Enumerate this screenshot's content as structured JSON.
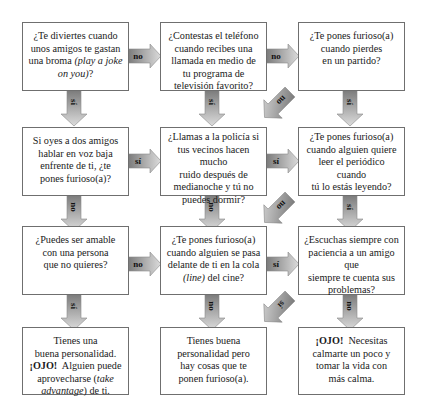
{
  "diagram": {
    "type": "flowchart",
    "colors": {
      "arrow_dark": "#7a7a7a",
      "arrow_light": "#d9d9d9",
      "border": "#6f6f6f"
    },
    "boxes": [
      {
        "id": "q1",
        "row": 1,
        "col": 1,
        "lines": [
          "¿Te diviertes cuando",
          "unos amigos te gastan",
          "una broma (play a joke",
          "on you)?"
        ],
        "italic_parts": [
          "play a joke on you"
        ]
      },
      {
        "id": "q2",
        "row": 1,
        "col": 2,
        "lines": [
          "¿Contestas el teléfono",
          "cuando recibes una",
          "llamada en medio de",
          "tu programa de",
          "televisión favorito?"
        ]
      },
      {
        "id": "q3",
        "row": 1,
        "col": 3,
        "lines": [
          "¿Te pones furioso(a)",
          "cuando pierdes",
          "en un partido?"
        ]
      },
      {
        "id": "q4",
        "row": 2,
        "col": 1,
        "lines": [
          "Si oyes a dos amigos",
          "hablar en voz baja",
          "enfrente de ti, ¿te",
          "pones furioso(a)?"
        ]
      },
      {
        "id": "q5",
        "row": 2,
        "col": 2,
        "lines": [
          "¿Llamas a la policía si",
          "tus vecinos hacen mucho",
          "ruido después de",
          "medianoche y tú no",
          "puedes dormir?"
        ]
      },
      {
        "id": "q6",
        "row": 2,
        "col": 3,
        "lines": [
          "¿Te pones furioso(a)",
          "cuando alguien quiere",
          "leer el periódico cuando",
          "tú lo estás leyendo?"
        ]
      },
      {
        "id": "q7",
        "row": 3,
        "col": 1,
        "lines": [
          "¿Puedes ser amable",
          "con una persona",
          "que no quieres?"
        ]
      },
      {
        "id": "q8",
        "row": 3,
        "col": 2,
        "lines": [
          "¿Te pones furioso(a)",
          "cuando alguien se pasa",
          "delante de ti en la cola",
          "(line) del cine?"
        ],
        "italic_parts": [
          "line"
        ]
      },
      {
        "id": "q9",
        "row": 3,
        "col": 3,
        "lines": [
          "¿Escuchas siempre con",
          "paciencia a un amigo que",
          "siempre te cuenta sus",
          "problemas?"
        ]
      },
      {
        "id": "r1",
        "row": 4,
        "col": 1,
        "lines": [
          "Tienes una",
          "buena personalidad.",
          "¡OJO! Alguien puede",
          "aprovecharse (take",
          "advantage) de ti."
        ],
        "bold_parts": [
          "¡OJO!"
        ],
        "italic_parts": [
          "take advantage"
        ]
      },
      {
        "id": "r2",
        "row": 4,
        "col": 2,
        "lines": [
          "Tienes buena",
          "personalidad pero",
          "hay cosas que te",
          "ponen furioso(a)."
        ]
      },
      {
        "id": "r3",
        "row": 4,
        "col": 3,
        "lines": [
          "¡OJO! Necesitas",
          "calmarte un poco y",
          "tomar la vida con",
          "más calma."
        ],
        "bold_parts": [
          "¡OJO!"
        ]
      }
    ],
    "arrows": [
      {
        "from": "q1",
        "to": "q2",
        "label": "no",
        "direction": "right"
      },
      {
        "from": "q2",
        "to": "q3",
        "label": "no",
        "direction": "right"
      },
      {
        "from": "q1",
        "to": "q4",
        "label": "sí",
        "direction": "down"
      },
      {
        "from": "q2",
        "to": "q5",
        "label": "sí",
        "direction": "down"
      },
      {
        "from": "q3",
        "to": "q6",
        "label": "sí",
        "direction": "down"
      },
      {
        "from": "q3",
        "to": "q5",
        "label": "no",
        "direction": "down-left"
      },
      {
        "from": "q4",
        "to": "q5",
        "label": "sí",
        "direction": "right"
      },
      {
        "from": "q5",
        "to": "q6",
        "label": "sí",
        "direction": "right"
      },
      {
        "from": "q4",
        "to": "q7",
        "label": "no",
        "direction": "down"
      },
      {
        "from": "q5",
        "to": "q8",
        "label": "no",
        "direction": "down"
      },
      {
        "from": "q6",
        "to": "q9",
        "label": "sí",
        "direction": "down"
      },
      {
        "from": "q6",
        "to": "q8",
        "label": "no",
        "direction": "down-left"
      },
      {
        "from": "q7",
        "to": "q8",
        "label": "no",
        "direction": "right"
      },
      {
        "from": "q8",
        "to": "q9",
        "label": "sí",
        "direction": "right"
      },
      {
        "from": "q7",
        "to": "r1",
        "label": "sí",
        "direction": "down"
      },
      {
        "from": "q8",
        "to": "r2",
        "label": "no",
        "direction": "down"
      },
      {
        "from": "q9",
        "to": "r3",
        "label": "no",
        "direction": "down"
      },
      {
        "from": "q9",
        "to": "r2",
        "label": "sí",
        "direction": "down-left"
      }
    ]
  }
}
